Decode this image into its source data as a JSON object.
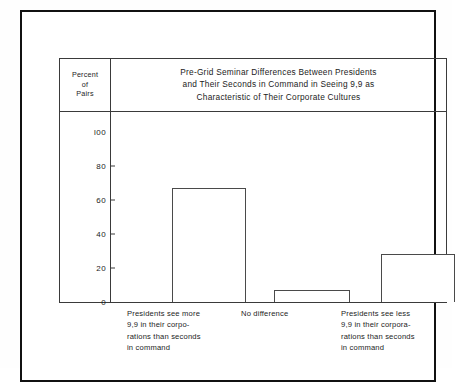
{
  "figure": {
    "axis_caption": {
      "line1": "Percent",
      "line2": "of",
      "line3": "Pairs"
    },
    "title": {
      "line1": "Pre-Grid Seminar Differences Between Presidents",
      "line2": "and Their Seconds in Command in Seeing 9,9 as",
      "line3": "Characteristic of Their Corporate Cultures"
    }
  },
  "chart_data": {
    "type": "bar",
    "title": "Pre-Grid Seminar Differences Between Presidents and Their Seconds in Command in Seeing 9,9 as Characteristic of Their Corporate Cultures",
    "xlabel": "",
    "ylabel": "Percent of Pairs",
    "ylim": [
      0,
      100
    ],
    "yticks": [
      0,
      20,
      40,
      60,
      80,
      100
    ],
    "ytick_labels": [
      "0",
      "20",
      "40",
      "60",
      "80",
      "l00"
    ],
    "grid": false,
    "legend": false,
    "categories": [
      "Presidents see more 9,9 in their corporations than seconds in command",
      "No difference",
      "Presidents see less 9,9 in their corporations than seconds in command"
    ],
    "category_label_lines": [
      [
        "Presidents see more",
        "9,9 in their corpo-",
        "rations than seconds",
        "in command"
      ],
      [
        "No difference"
      ],
      [
        "Presidents see less",
        "9,9 in their corpora-",
        "rations than seconds",
        "in command"
      ]
    ],
    "values": [
      67,
      7,
      28
    ],
    "colors": {
      "bar_fill": "#ffffff",
      "bar_stroke": "#4a4a4a",
      "axis": "#3a3a3a",
      "frame": "#111111",
      "text": "#1c1c1c",
      "background": "#ffffff"
    }
  }
}
